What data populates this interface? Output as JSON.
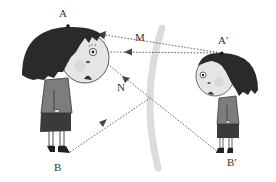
{
  "diagram": {
    "title": "",
    "labels": {
      "A": "A",
      "B": "B",
      "M": "M",
      "N": "N",
      "A_prime": "A′",
      "B_prime": "B′"
    },
    "elements": {
      "person": "girl standing in front of mirror (object AB)",
      "image": "girl's reflection (image A′B′)",
      "mirror": "vertical plane mirror (gray curved strip)",
      "rays": [
        "A′ to eye via M",
        "top-of-head ray to A′",
        "B′ to eye via N",
        "B to N"
      ]
    },
    "colors": {
      "hair": "#2a2a2a",
      "face": "#e6e6e6",
      "body": "#7d7d7d",
      "skirt": "#3a3a3a",
      "mirror": "#d9d9d9",
      "ray": "#555555",
      "label": "#333333"
    }
  }
}
